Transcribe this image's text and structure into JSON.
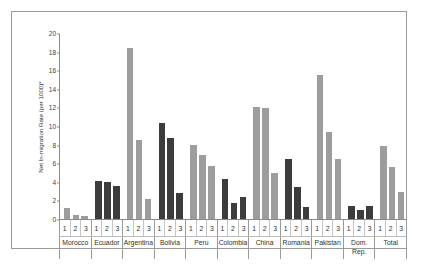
{
  "chart_data": {
    "type": "bar",
    "title": "",
    "xlabel": "",
    "ylabel": "Net In-migration Rate (per 1000)*",
    "ylim": [
      0,
      20
    ],
    "ytick_values": [
      0,
      2,
      4,
      6,
      8,
      10,
      12,
      14,
      16,
      18,
      20
    ],
    "ytick_labels": [
      "0",
      "2",
      "4",
      "6",
      "8",
      "10",
      "12",
      "14",
      "16",
      "18",
      "20"
    ],
    "grid": false,
    "legend": "none",
    "bar_labels": [
      "1",
      "2",
      "3"
    ],
    "categories": [
      "Morocco",
      "Ecuador",
      "Argentina",
      "Bolivia",
      "Peru",
      "Colombia",
      "China",
      "Romania",
      "Pakistan",
      "Dom. Rep.",
      "Total"
    ],
    "category_label_lines": [
      [
        "Morocco"
      ],
      [
        "Ecuador"
      ],
      [
        "Argentina"
      ],
      [
        "Bolivia"
      ],
      [
        "Peru"
      ],
      [
        "Colombia"
      ],
      [
        "China"
      ],
      [
        "Romania"
      ],
      [
        "Pakistan"
      ],
      [
        "Dom.",
        "Rep."
      ],
      [
        "Total"
      ]
    ],
    "groups": [
      {
        "category": "Morocco",
        "color": "light",
        "values": [
          1.2,
          0.45,
          0.3
        ]
      },
      {
        "category": "Ecuador",
        "color": "dark",
        "values": [
          4.1,
          4.0,
          3.55
        ]
      },
      {
        "category": "Argentina",
        "color": "light",
        "values": [
          18.35,
          8.5,
          2.15
        ]
      },
      {
        "category": "Bolivia",
        "color": "dark",
        "values": [
          10.35,
          8.7,
          2.8
        ]
      },
      {
        "category": "Peru",
        "color": "light",
        "values": [
          8.0,
          6.9,
          5.65
        ]
      },
      {
        "category": "Colombia",
        "color": "dark",
        "values": [
          4.3,
          1.75,
          2.4
        ]
      },
      {
        "category": "China",
        "color": "light",
        "values": [
          12.05,
          11.95,
          4.95
        ]
      },
      {
        "category": "Romania",
        "color": "dark",
        "values": [
          6.4,
          3.4,
          1.25
        ]
      },
      {
        "category": "Pakistan",
        "color": "light",
        "values": [
          15.45,
          9.4,
          6.5
        ]
      },
      {
        "category": "Dom. Rep.",
        "color": "dark",
        "values": [
          1.35,
          1.0,
          1.4
        ]
      },
      {
        "category": "Total",
        "color": "light",
        "values": [
          7.9,
          5.55,
          2.95
        ]
      }
    ],
    "colors": {
      "dark": "#3c3c3c",
      "light": "#9d9d9d",
      "axis": "#8a8a8a",
      "frame": "#9a9a9a",
      "text": "#2f2f2f",
      "background": "#ffffff"
    }
  }
}
